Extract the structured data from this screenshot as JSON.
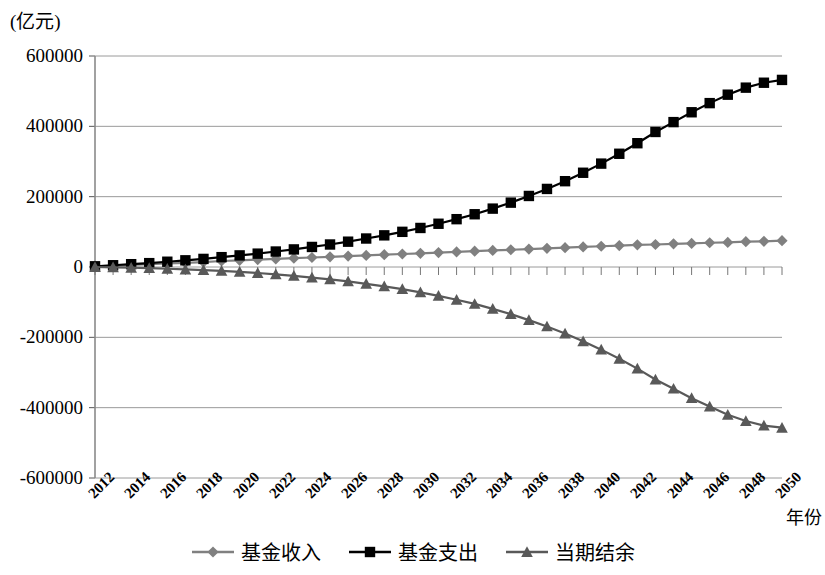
{
  "chart_data": {
    "type": "line",
    "title": "",
    "subtitle": "",
    "xlabel": "年份",
    "ylabel": "(亿元)",
    "unit_label": "(亿元)",
    "grid": true,
    "legend_position": "bottom",
    "ylim": [
      -600000,
      600000
    ],
    "ytick_labels": [
      "600000",
      "400000",
      "200000",
      "0",
      "-200000",
      "-400000",
      "-600000"
    ],
    "ytick_values": [
      600000,
      400000,
      200000,
      0,
      -200000,
      -400000,
      -600000
    ],
    "xlim": [
      2012,
      2050
    ],
    "xtick_labels": [
      "2012",
      "2014",
      "2016",
      "2018",
      "2020",
      "2022",
      "2024",
      "2026",
      "2028",
      "2030",
      "2032",
      "2034",
      "2036",
      "2038",
      "2040",
      "2042",
      "2044",
      "2046",
      "2048",
      "2050"
    ],
    "x": [
      2012,
      2013,
      2014,
      2015,
      2016,
      2017,
      2018,
      2019,
      2020,
      2021,
      2022,
      2023,
      2024,
      2025,
      2026,
      2027,
      2028,
      2029,
      2030,
      2031,
      2032,
      2033,
      2034,
      2035,
      2036,
      2037,
      2038,
      2039,
      2040,
      2041,
      2042,
      2043,
      2044,
      2045,
      2046,
      2047,
      2048,
      2049,
      2050
    ],
    "series": [
      {
        "name": "基金收入",
        "marker": "diamond",
        "color": "#808080",
        "values": [
          2000,
          4000,
          6000,
          8000,
          10000,
          12000,
          14000,
          17000,
          19000,
          21000,
          23000,
          25000,
          27000,
          29000,
          31000,
          33000,
          35000,
          37000,
          39000,
          41000,
          43000,
          45000,
          47000,
          49000,
          51000,
          53000,
          55000,
          57000,
          59000,
          61000,
          63000,
          64000,
          66000,
          67000,
          69000,
          70000,
          72000,
          73000,
          75000
        ]
      },
      {
        "name": "基金支出",
        "marker": "square",
        "color": "#000000",
        "values": [
          2000,
          5000,
          8000,
          11000,
          15000,
          19000,
          23000,
          28000,
          33000,
          38000,
          44000,
          50000,
          57000,
          64000,
          72000,
          81000,
          90000,
          100000,
          111000,
          123000,
          136000,
          150000,
          166000,
          183000,
          202000,
          222000,
          244000,
          268000,
          294000,
          322000,
          352000,
          384000,
          412000,
          440000,
          466000,
          490000,
          510000,
          524000,
          532000
        ]
      },
      {
        "name": "当期结余",
        "marker": "triangle",
        "color": "#595959",
        "values": [
          0,
          -1000,
          -2000,
          -3000,
          -5000,
          -7000,
          -9000,
          -11000,
          -14000,
          -17000,
          -21000,
          -25000,
          -30000,
          -35000,
          -41000,
          -48000,
          -55000,
          -63000,
          -72000,
          -82000,
          -93000,
          -105000,
          -119000,
          -134000,
          -151000,
          -169000,
          -189000,
          -211000,
          -235000,
          -261000,
          -289000,
          -320000,
          -346000,
          -373000,
          -397000,
          -420000,
          -438000,
          -451000,
          -457000
        ]
      }
    ]
  },
  "legend": {
    "items": [
      {
        "label": "基金收入",
        "marker": "diamond",
        "color": "#808080"
      },
      {
        "label": "基金支出",
        "marker": "square",
        "color": "#000000"
      },
      {
        "label": "当期结余",
        "marker": "triangle",
        "color": "#595959"
      }
    ]
  },
  "axes": {
    "x_title": "年份",
    "y_unit": "(亿元)"
  }
}
